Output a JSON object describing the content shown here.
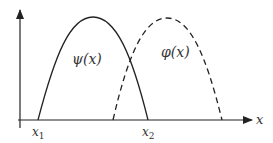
{
  "diagram": {
    "curves": [
      {
        "name": "psi",
        "label": "ψ(x)",
        "style": "solid"
      },
      {
        "name": "phi",
        "label": "φ(x)",
        "style": "dashed"
      }
    ],
    "axis": {
      "x_label": "x"
    },
    "ticks": {
      "x1": "x",
      "x1_sub": "1",
      "x2": "x",
      "x2_sub": "2"
    },
    "colors": {
      "stroke": "#222222",
      "text": "#333333"
    }
  }
}
